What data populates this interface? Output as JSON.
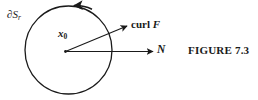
{
  "figure": {
    "caption": "FIGURE 7.3",
    "background_color": "#ffffff",
    "ink_color": "#1a1a1a",
    "width": 258,
    "height": 100
  },
  "labels": {
    "boundary": {
      "base": "∂S",
      "subscript": "r",
      "full": "∂S_r"
    },
    "center_point": {
      "base": "x",
      "subscript": "0",
      "full": "x₀"
    },
    "curl_field": {
      "operator": "curl",
      "variable": "F",
      "full": "curl F"
    },
    "normal": {
      "full": "N"
    }
  },
  "geometry": {
    "circle": {
      "center_x": 68.5,
      "center_y": 50.0,
      "radius_x": 43.5,
      "radius_y": 44.0,
      "stroke_width": 1.3,
      "orientation": "counterclockwise",
      "arrowhead_position": "top"
    },
    "center_dot": {
      "x": 65.5,
      "y": 51.5,
      "radius": 1.3
    },
    "arrow_curl": {
      "x1": 65.5,
      "y1": 51.5,
      "x2": 128.0,
      "y2": 25.5
    },
    "arrow_normal": {
      "x1": 65.5,
      "y1": 51.5,
      "x2": 154.0,
      "y2": 51.5
    }
  }
}
